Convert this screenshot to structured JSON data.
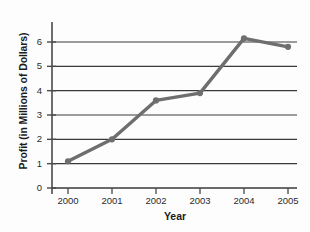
{
  "chart_data": {
    "type": "line",
    "title": "",
    "xlabel": "Year",
    "ylabel": "Profit (in Millions of Dollars)",
    "categories": [
      "2000",
      "2001",
      "2002",
      "2003",
      "2004",
      "2005"
    ],
    "x": [
      2000,
      2001,
      2002,
      2003,
      2004,
      2005
    ],
    "values": [
      1.1,
      2.0,
      3.6,
      3.9,
      6.15,
      5.8
    ],
    "series": [
      {
        "name": "Profit",
        "values": [
          1.1,
          2.0,
          3.6,
          3.9,
          6.15,
          5.8
        ]
      }
    ],
    "ylim": [
      0,
      6.6
    ],
    "xlim": [
      1999.6,
      2005.4
    ],
    "yticks": [
      0,
      1,
      2,
      3,
      4,
      5,
      6
    ],
    "ytick_labels": [
      "0",
      "1",
      "2",
      "3",
      "4",
      "5",
      "6"
    ],
    "xtick_labels": [
      "2000",
      "2001",
      "2002",
      "2003",
      "2004",
      "2005"
    ],
    "grid": "horizontal",
    "legend": "none",
    "line_color": "#6e6e6e",
    "marker_color": "#6e6e6e",
    "grid_color": "#3a3a3a",
    "axis_color": "#4a4a4a",
    "background": "#fdfdfd"
  }
}
